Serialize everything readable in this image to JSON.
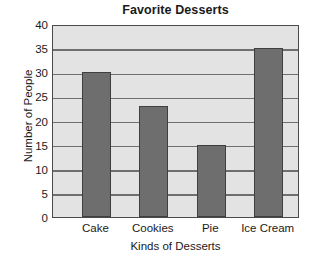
{
  "chart_data": {
    "type": "bar",
    "title": "Favorite Desserts",
    "xlabel": "Kinds of Desserts",
    "ylabel": "Number of People",
    "categories": [
      "Cake",
      "Cookies",
      "Pie",
      "Ice Cream"
    ],
    "values": [
      30,
      23,
      15,
      35
    ],
    "ylim": [
      0,
      40
    ],
    "ytick_labels": [
      "0",
      "5",
      "10",
      "15",
      "20",
      "25",
      "30",
      "35",
      "40"
    ],
    "ytick_values": [
      0,
      5,
      10,
      15,
      20,
      25,
      30,
      35,
      40
    ],
    "ytick_step": 5,
    "grid": true,
    "legend": null,
    "series": [
      {
        "name": "Number of People",
        "values": [
          30,
          23,
          15,
          35
        ]
      }
    ],
    "colors": {
      "bar_fill": "#6e6e6e",
      "bar_edge": "#3f3f3f",
      "plot_background": "#e3e3e3",
      "gridline": "#6f6f6f",
      "axis_border": "#4a4a4a",
      "figure_background": "#ffffff",
      "text": "#1a1a1a"
    }
  }
}
